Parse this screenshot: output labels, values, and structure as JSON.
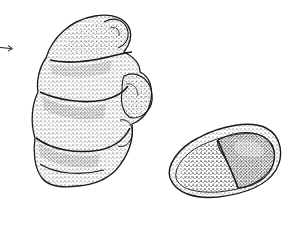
{
  "figure": {
    "background": "#ffffff",
    "ink": "#1a1a1a",
    "elements": [
      {
        "name": "pointer-arrow",
        "direction": "right",
        "x": 0,
        "y": 47
      },
      {
        "name": "specimen-side-view",
        "shape": "elongated coiled shell with segmented chambers"
      },
      {
        "name": "specimen-apertural-view",
        "shape": "oval shell with two chambers"
      }
    ]
  }
}
